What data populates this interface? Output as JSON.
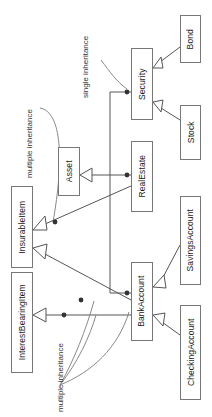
{
  "diagram": {
    "type": "uml-class-diagram",
    "orientation": "rotated-90-ccw",
    "colors": {
      "background": "#ffffff",
      "box_border": "#777777",
      "box_fill": "#ffffff",
      "line": "#555555",
      "text": "#1a1a1a",
      "annotation_text": "#333333",
      "junction_dot": "#333333"
    },
    "classes": [
      {
        "id": "bond",
        "label": "Bond",
        "x": 180,
        "y": 15,
        "w": 21,
        "h": 48
      },
      {
        "id": "security",
        "label": "Security",
        "x": 131,
        "y": 48,
        "w": 22,
        "h": 72
      },
      {
        "id": "stock",
        "label": "Stock",
        "x": 180,
        "y": 105,
        "w": 21,
        "h": 55
      },
      {
        "id": "asset",
        "label": "Asset",
        "x": 58,
        "y": 147,
        "w": 22,
        "h": 49
      },
      {
        "id": "realestate",
        "label": "RealEstate",
        "x": 131,
        "y": 141,
        "w": 22,
        "h": 71
      },
      {
        "id": "insurableitem",
        "label": "InsurableItem",
        "x": 11,
        "y": 186,
        "w": 22,
        "h": 82
      },
      {
        "id": "savingsaccount",
        "label": "SavingsAccount",
        "x": 180,
        "y": 196,
        "w": 21,
        "h": 89
      },
      {
        "id": "interestbearing",
        "label": "InterestBearingItem",
        "x": 11,
        "y": 272,
        "w": 22,
        "h": 101
      },
      {
        "id": "bankaccount",
        "label": "BankAccount",
        "x": 131,
        "y": 262,
        "w": 22,
        "h": 79
      },
      {
        "id": "checkingaccount",
        "label": "CheckingAccount",
        "x": 180,
        "y": 305,
        "w": 21,
        "h": 95
      }
    ],
    "annotations": [
      {
        "id": "ann-single",
        "text": "single inheritance",
        "x": 82,
        "y": 98
      },
      {
        "id": "ann-multiple-1",
        "text": "multiple inheritance",
        "x": 26,
        "y": 178
      },
      {
        "id": "ann-multiple-2",
        "text": "multiple inheritance",
        "x": 57,
        "y": 412
      }
    ],
    "relationships": [
      {
        "from": "Bond",
        "to": "Security",
        "kind": "generalization"
      },
      {
        "from": "Stock",
        "to": "Security",
        "kind": "generalization"
      },
      {
        "from": "RealEstate",
        "to": "Asset",
        "kind": "generalization"
      },
      {
        "from": "Security",
        "to": "Asset",
        "kind": "generalization"
      },
      {
        "from": "BankAccount",
        "to": "Asset",
        "kind": "generalization"
      },
      {
        "from": "RealEstate",
        "to": "InsurableItem",
        "kind": "generalization"
      },
      {
        "from": "BankAccount",
        "to": "InsurableItem",
        "kind": "generalization"
      },
      {
        "from": "BankAccount",
        "to": "InterestBearingItem",
        "kind": "generalization"
      },
      {
        "from": "SavingsAccount",
        "to": "BankAccount",
        "kind": "generalization"
      },
      {
        "from": "CheckingAccount",
        "to": "BankAccount",
        "kind": "generalization"
      }
    ]
  }
}
